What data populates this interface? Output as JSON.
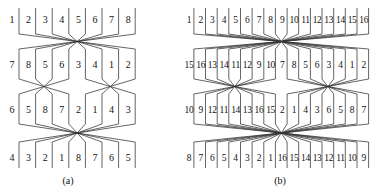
{
  "figure": {
    "panels": [
      {
        "id": "a",
        "caption": "(a)",
        "size": 8,
        "rows": [
          [
            1,
            2,
            3,
            4,
            5,
            6,
            7,
            8
          ],
          [
            7,
            8,
            5,
            6,
            3,
            4,
            1,
            2
          ],
          [
            6,
            5,
            8,
            7,
            2,
            1,
            4,
            3
          ],
          [
            4,
            3,
            2,
            1,
            8,
            7,
            6,
            5
          ]
        ]
      },
      {
        "id": "b",
        "caption": "(b)",
        "size": 16,
        "rows": [
          [
            1,
            2,
            3,
            4,
            5,
            6,
            7,
            8,
            9,
            10,
            11,
            12,
            13,
            14,
            15,
            16
          ],
          [
            15,
            16,
            13,
            14,
            11,
            12,
            9,
            10,
            7,
            8,
            5,
            6,
            3,
            4,
            1,
            2
          ],
          [
            10,
            9,
            12,
            11,
            14,
            13,
            16,
            15,
            2,
            1,
            4,
            3,
            6,
            5,
            8,
            7
          ],
          [
            8,
            7,
            6,
            5,
            4,
            3,
            2,
            1,
            16,
            15,
            14,
            13,
            12,
            11,
            10,
            9
          ]
        ]
      }
    ]
  }
}
